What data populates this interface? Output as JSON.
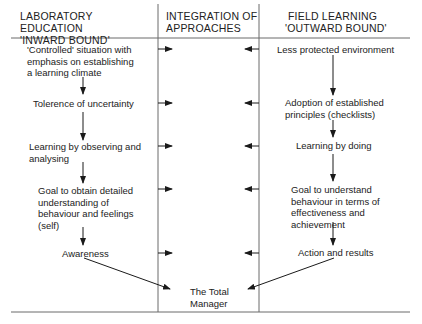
{
  "columns": {
    "left": {
      "title_line1": "LABORATORY EDUCATION",
      "title_line2": "'INWARD BOUND'"
    },
    "middle": {
      "title_line1": "INTEGRATION OF",
      "title_line2": "APPROACHES"
    },
    "right": {
      "title_line1": "FIELD LEARNING",
      "title_line2": "'OUTWARD BOUND'"
    }
  },
  "left_steps": [
    {
      "l1": "'Controlled' situation with",
      "l2": "emphasis on establishing",
      "l3": "a learning climate"
    },
    {
      "l1": "Tolerence of uncertainty"
    },
    {
      "l1": "Learning by observing and",
      "l2": "analysing"
    },
    {
      "l1": "Goal to obtain detailed",
      "l2": "understanding of",
      "l3": "behaviour and feelings",
      "l4": "(self)"
    },
    {
      "l1": "Awareness"
    }
  ],
  "right_steps": [
    {
      "l1": "Less protected environment"
    },
    {
      "l1": "Adoption of established",
      "l2": "principles (checklists)"
    },
    {
      "l1": "Learning by doing"
    },
    {
      "l1": "Goal to understand",
      "l2": "behaviour in terms of",
      "l3": "effectiveness and",
      "l4": "achievement"
    },
    {
      "l1": "Action and results"
    }
  ],
  "result": {
    "line1": "The Total",
    "line2": "Manager"
  },
  "colors": {
    "line": "#6a6a6a",
    "arrow": "#1a1a1a",
    "text": "#222222"
  }
}
